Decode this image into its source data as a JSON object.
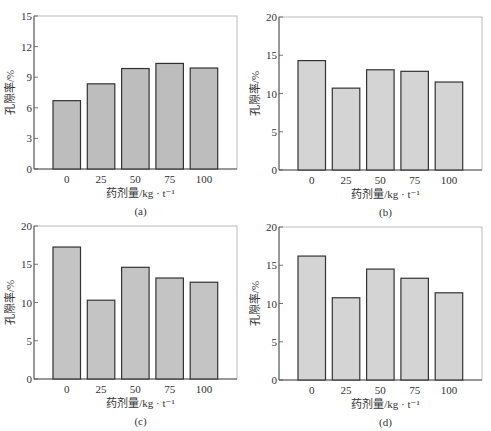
{
  "chart_data": [
    {
      "type": "bar",
      "panel_label": "(a)",
      "categories": [
        "0",
        "25",
        "50",
        "75",
        "100"
      ],
      "values": [
        6.7,
        8.35,
        9.85,
        10.35,
        9.9
      ],
      "xlabel": "药剂量/kg · t⁻¹",
      "ylabel": "孔隙率/%",
      "ylim": [
        0,
        15
      ],
      "yticks": [
        0,
        3,
        6,
        9,
        12,
        15
      ],
      "bar_color": "#bdbdbd",
      "grid": false
    },
    {
      "type": "bar",
      "panel_label": "(b)",
      "categories": [
        "0",
        "25",
        "50",
        "75",
        "100"
      ],
      "values": [
        14.3,
        10.7,
        13.1,
        12.9,
        11.5
      ],
      "xlabel": "药剂量/kg · t⁻¹",
      "ylabel": "孔隙率/%",
      "ylim": [
        0,
        20
      ],
      "yticks": [
        0,
        5,
        10,
        15,
        20
      ],
      "bar_color": "#d4d4d4",
      "grid": false
    },
    {
      "type": "bar",
      "panel_label": "(c)",
      "categories": [
        "0",
        "25",
        "50",
        "75",
        "100"
      ],
      "values": [
        17.25,
        10.3,
        14.6,
        13.2,
        12.65
      ],
      "xlabel": "药剂量/kg · t⁻¹",
      "ylabel": "孔隙率/%",
      "ylim": [
        0,
        20
      ],
      "yticks": [
        0,
        5,
        10,
        15,
        20
      ],
      "bar_color": "#c4c4c4",
      "grid": false
    },
    {
      "type": "bar",
      "panel_label": "(d)",
      "categories": [
        "0",
        "25",
        "50",
        "75",
        "100"
      ],
      "values": [
        16.2,
        10.75,
        14.5,
        13.3,
        11.4
      ],
      "xlabel": "药剂量/kg · t⁻¹",
      "ylabel": "孔隙率/%",
      "ylim": [
        0,
        20
      ],
      "yticks": [
        0,
        5,
        10,
        15,
        20
      ],
      "bar_color": "#d4d4d4",
      "grid": false
    }
  ],
  "layout": {
    "panels": [
      {
        "left": 34,
        "top": 16,
        "width": 203,
        "height": 153
      },
      {
        "left": 279,
        "top": 17,
        "width": 203,
        "height": 153
      },
      {
        "left": 34,
        "top": 226,
        "width": 203,
        "height": 153
      },
      {
        "left": 279,
        "top": 227,
        "width": 203,
        "height": 153
      }
    ],
    "colors": {
      "axis": "#555555",
      "frame": "#aaaaaa",
      "bar_edge": "#333333"
    }
  }
}
